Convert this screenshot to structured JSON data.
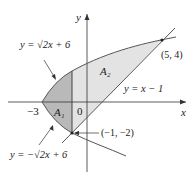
{
  "figure": {
    "axis_x_label": "x",
    "axis_y_label": "y",
    "origin_label": "0",
    "tick_minus3": "−3",
    "curve_upper_label": "y = √2x + 6",
    "curve_lower_label": "y = −√2x + 6",
    "line_label": "y = x − 1",
    "region_1_label": "A₁",
    "region_2_label": "A₂",
    "point_top_label": "(5, 4)",
    "point_bottom_label": "(−1, −2)",
    "colors": {
      "region_1": "#b9b9b9",
      "region_2": "#e3e3e3",
      "curve": "#555555",
      "axis": "#333333"
    }
  }
}
